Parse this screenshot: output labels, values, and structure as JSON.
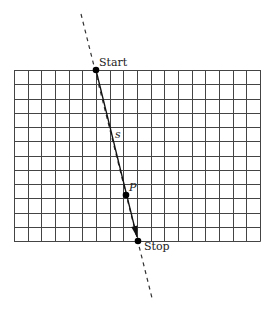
{
  "diagram": {
    "type": "ray-traversal-grid",
    "grid": {
      "x0": 14,
      "y0": 70,
      "x1": 260,
      "y1": 241,
      "columns": 18,
      "rows": 12,
      "line_color": "#444444"
    },
    "guide_line": {
      "style": "dashed",
      "from": [
        81,
        14
      ],
      "to": [
        152,
        298
      ],
      "color": "#333333"
    },
    "segment": {
      "from": [
        96,
        70
      ],
      "to": [
        138,
        241
      ],
      "color": "#111111",
      "arrow_tip": [
        137,
        237
      ],
      "label": "s",
      "label_pos": [
        115,
        138
      ]
    },
    "points": [
      {
        "id": "start",
        "label": "Start",
        "x": 96,
        "y": 70,
        "label_x": 99,
        "label_y": 66
      },
      {
        "id": "p",
        "label": "P",
        "x": 126,
        "y": 195,
        "label_x": 129,
        "label_y": 191
      },
      {
        "id": "stop",
        "label": "Stop",
        "x": 138,
        "y": 241,
        "label_x": 144,
        "label_y": 250
      }
    ]
  }
}
